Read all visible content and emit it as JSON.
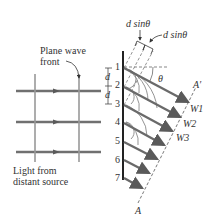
{
  "labels": {
    "plane_wave_front_line1": "Plane wave",
    "plane_wave_front_line2": "front",
    "light_source_line1": "Light from",
    "light_source_line2": "distant source",
    "dsin_top": "d sinθ",
    "dsin_right": "d sinθ",
    "theta": "θ",
    "d_upper": "d",
    "d_lower": "d",
    "a_prime": "A′",
    "a": "A",
    "w1": "W1",
    "w2": "W2",
    "w3": "W3"
  },
  "slits": [
    "1",
    "2",
    "3",
    "4",
    "5",
    "6",
    "7"
  ],
  "colors": {
    "ray": "#6e6e6e",
    "barrier": "#222222",
    "text": "#333333",
    "wavefront": "#8c8c8c"
  }
}
